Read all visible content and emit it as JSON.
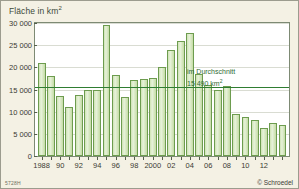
{
  "figure": {
    "title_prefix": "Fläche in km",
    "title_sup": "2",
    "catalog_code": "5728H",
    "copyright": "© Schroedel",
    "background_color": "#f4f1e4",
    "plot_background_color": "#ffffff",
    "bar_fill_color": "#d6e8bd",
    "bar_border_color": "#6d9c4f",
    "average_line_color": "#2f7d32"
  },
  "annotation": {
    "line1": "im Durchschnitt",
    "line2_prefix": "15 490 km",
    "line2_sup": "2"
  },
  "chart_data": {
    "type": "bar",
    "xlabel": "",
    "ylabel": "Fläche in km²",
    "ylim": [
      0,
      30000
    ],
    "ytick_labels": [
      "0",
      "5 000",
      "10 000",
      "15 000",
      "20 000",
      "25 000",
      "30 000"
    ],
    "ytick_values": [
      0,
      5000,
      10000,
      15000,
      20000,
      25000,
      30000
    ],
    "grid": true,
    "legend": "none",
    "categories": [
      "1988",
      "1989",
      "1990",
      "1991",
      "1992",
      "1993",
      "1994",
      "1995",
      "1996",
      "1997",
      "1998",
      "1999",
      "2000",
      "2001",
      "2002",
      "2003",
      "2004",
      "2005",
      "2006",
      "2007",
      "2008",
      "2009",
      "2010",
      "2011",
      "2012",
      "2013",
      "2014"
    ],
    "xtick_labels": [
      {
        "category": "1988",
        "label": "1988"
      },
      {
        "category": "1990",
        "label": "90"
      },
      {
        "category": "1992",
        "label": "92"
      },
      {
        "category": "1994",
        "label": "94"
      },
      {
        "category": "1996",
        "label": "96"
      },
      {
        "category": "1998",
        "label": "98"
      },
      {
        "category": "2000",
        "label": "2000"
      },
      {
        "category": "2002",
        "label": "02"
      },
      {
        "category": "2004",
        "label": "04"
      },
      {
        "category": "2006",
        "label": "06"
      },
      {
        "category": "2008",
        "label": "08"
      },
      {
        "category": "2010",
        "label": "10"
      },
      {
        "category": "2012",
        "label": "12"
      }
    ],
    "values": [
      21000,
      18000,
      13600,
      11100,
      13700,
      14800,
      14800,
      29500,
      18300,
      13200,
      17200,
      17300,
      17500,
      20000,
      23900,
      26000,
      27800,
      18400,
      16100,
      15000,
      15700,
      9400,
      8700,
      8200,
      6300,
      7500,
      7000
    ],
    "annotations": [
      {
        "type": "hline",
        "value": 15490,
        "label": "im Durchschnitt 15 490 km²",
        "color": "#2f7d32"
      }
    ]
  }
}
